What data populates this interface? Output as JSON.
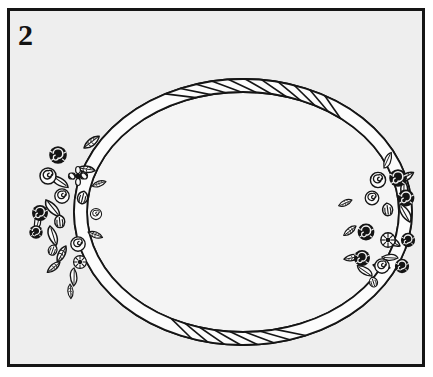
{
  "figure": {
    "number_label": "2",
    "style": "black-and-white line art / clip art"
  },
  "colors": {
    "page_background": "#ffffff",
    "panel_background": "#eeeeee",
    "oval_interior": "#f6f6f6",
    "ink": "#151515",
    "ink_soft": "#2a2a2a",
    "rope_fill": "#fcfcfc",
    "petal_fill": "#fbfbfb",
    "dark_blossom": "#141414",
    "border_color": "#151515"
  },
  "frame": {
    "border_width_px": 3,
    "inset_left_px": 7,
    "inset_top_px": 8,
    "width_px": 418,
    "height_px": 359
  },
  "oval": {
    "center_x": 243,
    "center_y": 212,
    "radius_x": 163,
    "radius_y": 127,
    "rope_band_width_px": 13,
    "rope_segment_count": 64,
    "texture": "twisted rope with diagonal segment divisions"
  },
  "clusters": [
    {
      "id": "left-cluster",
      "position": "left",
      "center_x": 72,
      "center_y": 212,
      "angle_span_degrees": [
        128,
        232
      ],
      "elements": [
        "dark-rose",
        "spiral-rose",
        "daisy",
        "tulip-bud",
        "leaf",
        "petal-spray"
      ],
      "blossom_count": 11,
      "leaf_count": 14
    },
    {
      "id": "right-cluster",
      "position": "right",
      "center_x": 388,
      "center_y": 225,
      "angle_span_degrees": [
        -42,
        58
      ],
      "elements": [
        "dark-rose",
        "spiral-rose",
        "rosette",
        "bud",
        "leaf",
        "petal-spray"
      ],
      "blossom_count": 12,
      "leaf_count": 12
    }
  ],
  "icons": {
    "rose": "rose-icon",
    "leaf": "leaf-icon",
    "daisy": "daisy-icon",
    "rope": "rope-icon"
  }
}
